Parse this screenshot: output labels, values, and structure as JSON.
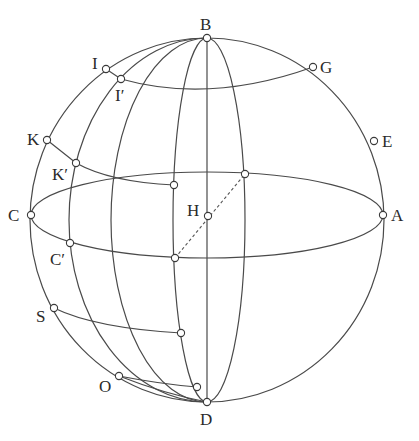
{
  "figure": {
    "type": "sphere-diagram",
    "colors": {
      "line": "#4a4a4a",
      "point_fill": "#ffffff",
      "background": "#ffffff"
    }
  },
  "labels": {
    "B": "B",
    "D": "D",
    "A": "A",
    "C": "C",
    "E": "E",
    "G": "G",
    "H": "H",
    "I": "I",
    "I_prime": "I′",
    "K": "K",
    "K_prime": "K′",
    "C_prime": "C′",
    "S": "S",
    "O": "O"
  },
  "points": [
    {
      "id": "B",
      "x": 207,
      "y": 38
    },
    {
      "id": "D",
      "x": 207,
      "y": 402
    },
    {
      "id": "A",
      "x": 383,
      "y": 215
    },
    {
      "id": "C",
      "x": 31,
      "y": 215
    },
    {
      "id": "E",
      "x": 374,
      "y": 141
    },
    {
      "id": "G",
      "x": 313,
      "y": 67
    },
    {
      "id": "H",
      "x": 208,
      "y": 216
    },
    {
      "id": "I",
      "x": 106,
      "y": 69
    },
    {
      "id": "I_prime",
      "x": 121,
      "y": 79
    },
    {
      "id": "K",
      "x": 47,
      "y": 140
    },
    {
      "id": "K_prime",
      "x": 76,
      "y": 163
    },
    {
      "id": "C_prime",
      "x": 70,
      "y": 243
    },
    {
      "id": "S",
      "x": 54,
      "y": 308
    },
    {
      "id": "O",
      "x": 119,
      "y": 376
    }
  ]
}
